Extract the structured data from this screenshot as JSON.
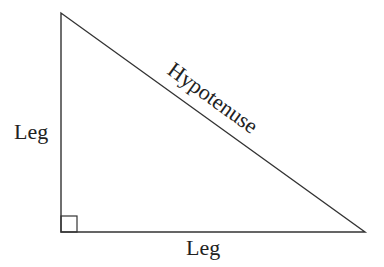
{
  "diagram": {
    "labels": {
      "left_leg": "Leg",
      "bottom_leg": "Leg",
      "hypotenuse": "Hypotenuse"
    },
    "vertices": {
      "top": [
        61,
        13
      ],
      "right_angle": [
        61,
        232
      ],
      "right": [
        365,
        232
      ]
    },
    "right_angle_marker_size": 16,
    "stroke_color": "#333333",
    "text_color": "#222222"
  }
}
